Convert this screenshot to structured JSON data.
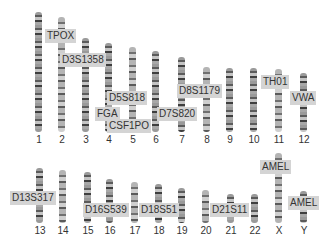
{
  "chromosomes": [
    {
      "id": "1",
      "x": 35,
      "top": 12,
      "height": 120
    },
    {
      "id": "2",
      "x": 58,
      "top": 17,
      "height": 115
    },
    {
      "id": "3",
      "x": 82,
      "top": 38,
      "height": 94
    },
    {
      "id": "4",
      "x": 105,
      "top": 43,
      "height": 89
    },
    {
      "id": "5",
      "x": 129,
      "top": 47,
      "height": 85
    },
    {
      "id": "6",
      "x": 152,
      "top": 51,
      "height": 81
    },
    {
      "id": "7",
      "x": 178,
      "top": 57,
      "height": 75
    },
    {
      "id": "8",
      "x": 203,
      "top": 67,
      "height": 65
    },
    {
      "id": "9",
      "x": 226,
      "top": 68,
      "height": 64
    },
    {
      "id": "10",
      "x": 250,
      "top": 68,
      "height": 64
    },
    {
      "id": "11",
      "x": 275,
      "top": 69,
      "height": 63
    },
    {
      "id": "12",
      "x": 300,
      "top": 73,
      "height": 59
    },
    {
      "id": "13",
      "x": 36,
      "top": 168,
      "height": 55
    },
    {
      "id": "14",
      "x": 59,
      "top": 170,
      "height": 53
    },
    {
      "id": "15",
      "x": 84,
      "top": 172,
      "height": 51
    },
    {
      "id": "16",
      "x": 106,
      "top": 179,
      "height": 44
    },
    {
      "id": "17",
      "x": 131,
      "top": 182,
      "height": 41
    },
    {
      "id": "18",
      "x": 155,
      "top": 184,
      "height": 39
    },
    {
      "id": "19",
      "x": 178,
      "top": 188,
      "height": 35
    },
    {
      "id": "20",
      "x": 202,
      "top": 190,
      "height": 33
    },
    {
      "id": "21",
      "x": 227,
      "top": 194,
      "height": 29
    },
    {
      "id": "22",
      "x": 251,
      "top": 194,
      "height": 29
    },
    {
      "id": "X",
      "x": 275,
      "top": 153,
      "height": 70
    },
    {
      "id": "Y",
      "x": 300,
      "top": 191,
      "height": 32
    }
  ],
  "numbers_row1_y": 134,
  "numbers_row2_y": 225,
  "loci": [
    {
      "name": "TPOX",
      "x": 45,
      "y": 29
    },
    {
      "name": "D3S1358",
      "x": 60,
      "y": 53
    },
    {
      "name": "D5S818",
      "x": 107,
      "y": 91
    },
    {
      "name": "FGA",
      "x": 95,
      "y": 107
    },
    {
      "name": "CSF1PO",
      "x": 107,
      "y": 119
    },
    {
      "name": "D7S820",
      "x": 157,
      "y": 107
    },
    {
      "name": "D8S1179",
      "x": 177,
      "y": 84
    },
    {
      "name": "TH01",
      "x": 261,
      "y": 75
    },
    {
      "name": "VWA",
      "x": 290,
      "y": 91
    },
    {
      "name": "D13S317",
      "x": 10,
      "y": 191
    },
    {
      "name": "D16S539",
      "x": 83,
      "y": 203
    },
    {
      "name": "D18S51",
      "x": 139,
      "y": 203
    },
    {
      "name": "D21S11",
      "x": 210,
      "y": 203
    },
    {
      "name": "AMEL",
      "x": 260,
      "y": 160
    },
    {
      "name": "AMEL",
      "x": 288,
      "y": 196
    }
  ]
}
